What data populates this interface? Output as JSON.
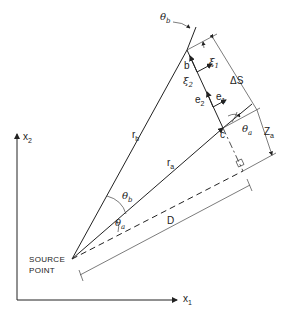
{
  "diagram": {
    "axes": {
      "x1": {
        "label": "x",
        "sub": "1"
      },
      "x2": {
        "label": "x",
        "sub": "2"
      }
    },
    "source_point": {
      "line1": "SOURCE",
      "line2": "POINT"
    },
    "points": {
      "b": "b",
      "c": "c"
    },
    "rays": {
      "rb": {
        "label": "r",
        "sub": "b"
      },
      "ra": {
        "label": "r",
        "sub": "a"
      }
    },
    "angles": {
      "theta_b_top": {
        "label": "θ",
        "sub": "b"
      },
      "theta_b_src": {
        "label": "θ",
        "sub": "b"
      },
      "theta_a_src": {
        "label": "θ",
        "sub": "a"
      },
      "theta_a_c": {
        "label": "θ",
        "sub": "a"
      }
    },
    "vectors": {
      "xi1": {
        "label": "ξ",
        "sub": "1"
      },
      "xi2": {
        "label": "ξ",
        "sub": "2"
      },
      "e1": {
        "label": "e",
        "sub": "1"
      },
      "e2": {
        "label": "e",
        "sub": "2"
      }
    },
    "dimensions": {
      "delta_s": "ΔS",
      "z_a": {
        "label": "Z",
        "sub": "a"
      },
      "d": "D"
    }
  }
}
